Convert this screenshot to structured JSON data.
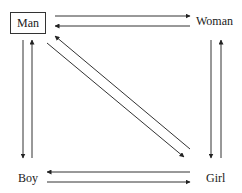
{
  "diagram": {
    "nodes": [
      {
        "id": "man",
        "label": "Man",
        "boxed": true
      },
      {
        "id": "woman",
        "label": "Woman",
        "boxed": false
      },
      {
        "id": "boy",
        "label": "Boy",
        "boxed": false
      },
      {
        "id": "girl",
        "label": "Girl",
        "boxed": false
      }
    ],
    "edges": [
      {
        "from": "man",
        "to": "woman"
      },
      {
        "from": "woman",
        "to": "man"
      },
      {
        "from": "man",
        "to": "boy"
      },
      {
        "from": "boy",
        "to": "man"
      },
      {
        "from": "woman",
        "to": "girl"
      },
      {
        "from": "girl",
        "to": "woman"
      },
      {
        "from": "man",
        "to": "girl"
      },
      {
        "from": "girl",
        "to": "man"
      },
      {
        "from": "girl",
        "to": "boy"
      },
      {
        "from": "boy",
        "to": "girl"
      }
    ],
    "colors": {
      "line": "#333333",
      "background": "#ffffff"
    }
  }
}
